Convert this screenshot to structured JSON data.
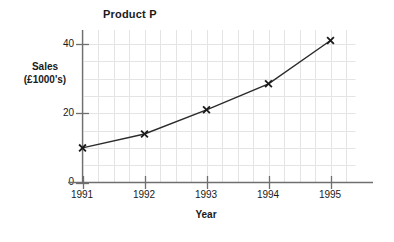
{
  "chart_data": {
    "type": "line",
    "title": "Product P",
    "xlabel": "Year",
    "ylabel": "Sales (£1000's)",
    "ylabel_lines": [
      "Sales",
      "(£1000's)"
    ],
    "categories": [
      "1991",
      "1992",
      "1993",
      "1994",
      "1995"
    ],
    "x": [
      1991,
      1992,
      1993,
      1994,
      1995
    ],
    "values": [
      10,
      14,
      21,
      28.5,
      41
    ],
    "series": [
      {
        "name": "Product P",
        "values": [
          10,
          14,
          21,
          28.5,
          41
        ]
      }
    ],
    "xlim": [
      1991,
      1995.4
    ],
    "ylim": [
      0,
      44
    ],
    "xticks": [
      "1991",
      "1992",
      "1993",
      "1994",
      "1995"
    ],
    "yticks": [
      "0",
      "20",
      "40"
    ],
    "ytick_values": [
      0,
      20,
      40
    ],
    "grid": true,
    "grid_minor_x_step": 0.25,
    "grid_minor_y_step": 5,
    "legend": "none",
    "marker": "x-cross",
    "line_color": "#2b2b2b",
    "marker_color": "#1a1a1a",
    "grid_color": "#e4e4e4",
    "axis_color": "#6f6f6f",
    "background_color": "#ffffff"
  }
}
